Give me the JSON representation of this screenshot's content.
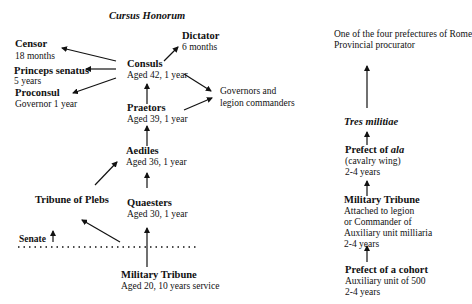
{
  "title": "Cursus Honorum",
  "left_chart": {
    "consuls": {
      "name": "Consuls",
      "detail": "Aged 42, 1 year"
    },
    "dictator": {
      "name": "Dictator",
      "detail": "6 months"
    },
    "censor": {
      "name": "Censor",
      "detail": "18 months"
    },
    "princeps": {
      "name": "Princeps senatus",
      "detail": "5 years"
    },
    "proconsul": {
      "name": "Proconsul",
      "detail": "Governor 1 year"
    },
    "governors": {
      "line1": "Governors and",
      "line2": "legion commanders"
    },
    "praetors": {
      "name": "Praetors",
      "detail": "Aged 39, 1 year"
    },
    "aediles": {
      "name": "Aediles",
      "detail": "Aged 36, 1 year"
    },
    "tribune_plebs": {
      "name": "Tribune of Plebs"
    },
    "quaesters": {
      "name": "Quaesters",
      "detail": "Aged 30, 1 year"
    },
    "senate": {
      "name": "Senate"
    },
    "military_tribune": {
      "name": "Military Tribune",
      "detail": "Aged 20, 10 years service"
    }
  },
  "right_chart": {
    "top": {
      "line1": "One of the four prefectures of Rome",
      "line2": "Provincial procurator"
    },
    "tres_militiae": {
      "name": "Tres militiae"
    },
    "prefect_ala": {
      "name_prefix": "Prefect of ",
      "name_italic": "ala",
      "line1": "(cavalry wing)",
      "line2": "2-4 years"
    },
    "military_tribune": {
      "name": "Military Tribune",
      "line1": "Attached to legion",
      "line2": "or Commander of",
      "line3": "Auxiliary unit milliaria",
      "line4": "2-4 years"
    },
    "prefect_cohort": {
      "name": "Prefect of a cohort",
      "line1": "Auxiliary unit of 500",
      "line2": "2-4 years"
    }
  },
  "colors": {
    "text": "#111111",
    "background": "#ffffff"
  }
}
